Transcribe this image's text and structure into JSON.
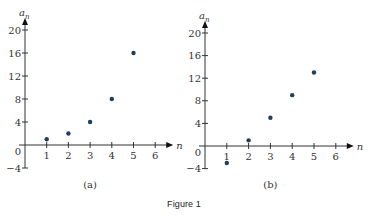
{
  "figure": {
    "caption": "Figure 1"
  },
  "style": {
    "point_color": "#1f3f5f",
    "axis_color": "#333333",
    "label_color": "#333333"
  },
  "chart_data": [
    {
      "type": "scatter",
      "panel_label": "(a)",
      "title": "",
      "xlabel": "n",
      "ylabel": "a_n",
      "ylabel_display": {
        "base": "a",
        "sub": "n"
      },
      "x": [
        1,
        2,
        3,
        4,
        5
      ],
      "y": [
        1,
        2,
        4,
        8,
        16
      ],
      "xlim": [
        0,
        6
      ],
      "ylim": [
        -4,
        20
      ],
      "x_ticks": [
        1,
        2,
        3,
        4,
        5,
        6
      ],
      "y_ticks": [
        -4,
        0,
        4,
        8,
        12,
        16,
        20
      ],
      "x_tick_labels": [
        "1",
        "2",
        "3",
        "4",
        "5",
        "6"
      ],
      "y_tick_labels": [
        "−4",
        "0",
        "4",
        "8",
        "12",
        "16",
        "20"
      ],
      "grid": false,
      "legend": null
    },
    {
      "type": "scatter",
      "panel_label": "(b)",
      "title": "",
      "xlabel": "n",
      "ylabel": "a_n",
      "ylabel_display": {
        "base": "a",
        "sub": "n"
      },
      "x": [
        1,
        2,
        3,
        4,
        5
      ],
      "y": [
        -3,
        1,
        5,
        9,
        13
      ],
      "xlim": [
        0,
        6
      ],
      "ylim": [
        -4,
        20
      ],
      "x_ticks": [
        1,
        2,
        3,
        4,
        5,
        6
      ],
      "y_ticks": [
        -4,
        0,
        4,
        8,
        12,
        16,
        20
      ],
      "x_tick_labels": [
        "1",
        "2",
        "3",
        "4",
        "5",
        "6"
      ],
      "y_tick_labels": [
        "−4",
        "0",
        "4",
        "8",
        "12",
        "16",
        "20"
      ],
      "grid": false,
      "legend": null
    }
  ]
}
